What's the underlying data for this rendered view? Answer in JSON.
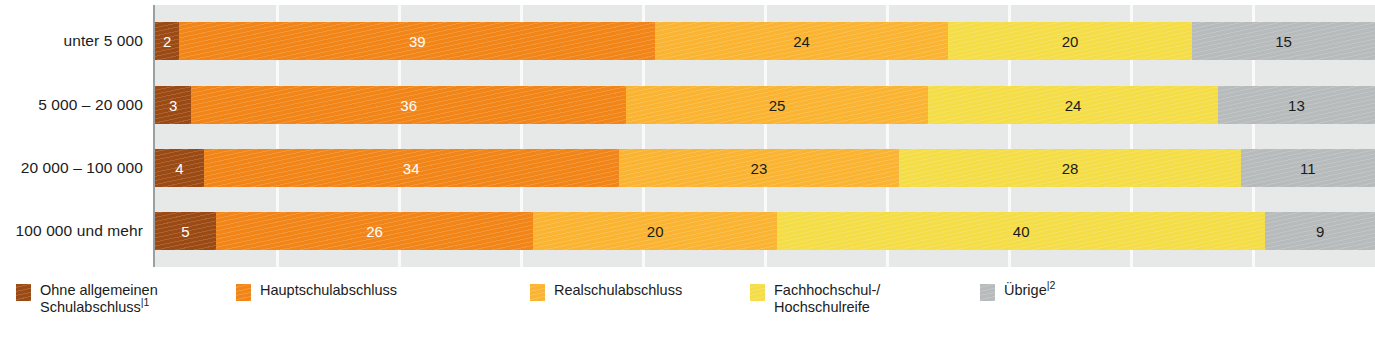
{
  "chart_data": {
    "type": "bar",
    "subtype": "horizontal-100-percent-stacked",
    "title": "",
    "xlabel": "",
    "ylabel": "",
    "xlim": [
      0,
      100
    ],
    "grid": true,
    "grid_axis": "x",
    "grid_step": 10,
    "legend_position": "bottom",
    "value_unit": "%",
    "categories": [
      "unter 5 000",
      "5 000 – 20 000",
      "20 000 – 100 000",
      "100 000 und mehr"
    ],
    "series": [
      {
        "name": "Ohne allgemeinen Schulabschluss",
        "name_line1": "Ohne allgemeinen",
        "name_line2": "Schulabschluss",
        "footnote": "1",
        "color": "#9c4a13",
        "label_color": "#ffffff",
        "values": [
          2,
          3,
          4,
          5
        ]
      },
      {
        "name": "Hauptschulabschluss",
        "name_line1": "Hauptschulabschluss",
        "name_line2": "",
        "footnote": "",
        "color": "#f28518",
        "label_color": "#ffffff",
        "values": [
          39,
          36,
          34,
          26
        ]
      },
      {
        "name": "Realschulabschluss",
        "name_line1": "Realschulabschluss",
        "name_line2": "",
        "footnote": "",
        "color": "#fab431",
        "label_color": "#1b1b1b",
        "values": [
          24,
          25,
          23,
          20
        ]
      },
      {
        "name": "Fachhochschul-/ Hochschulreife",
        "name_line1": "Fachhochschul-/",
        "name_line2": "Hochschulreife",
        "footnote": "",
        "color": "#f4dd46",
        "label_color": "#1b1b1b",
        "values": [
          20,
          24,
          28,
          40
        ]
      },
      {
        "name": "Übrige",
        "name_line1": "Übrige",
        "name_line2": "",
        "footnote": "2",
        "color": "#b7bbbb",
        "label_color": "#1b1b1b",
        "values": [
          15,
          13,
          11,
          9
        ]
      }
    ],
    "row_totals": [
      100,
      101,
      100,
      100
    ]
  },
  "style": {
    "plot_background": "#e7e9e9",
    "gridline_color": "#fafafa",
    "axis_color": "#9aa0a2",
    "page_background": "#ffffff",
    "text_color": "#1b1b1b"
  }
}
